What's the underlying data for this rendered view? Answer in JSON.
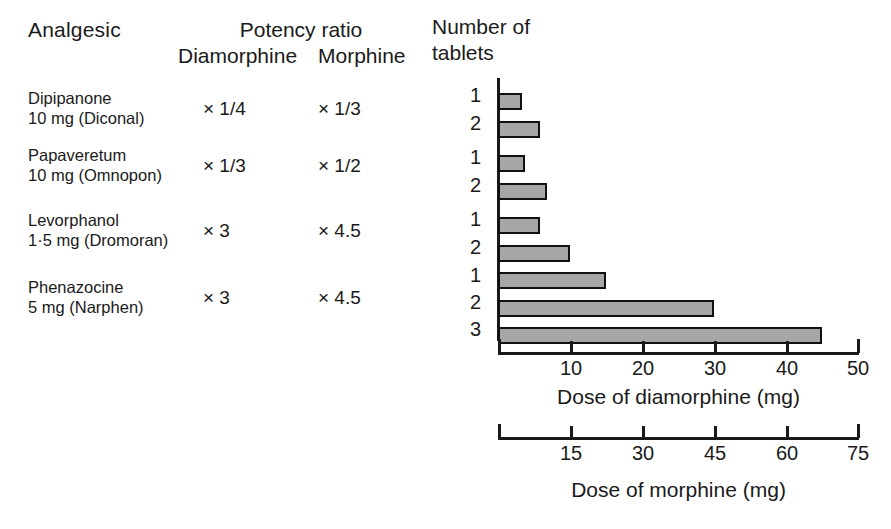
{
  "table": {
    "headers": {
      "analgesic": "Analgesic",
      "potency_ratio": "Potency ratio",
      "diamorphine": "Diamorphine",
      "morphine": "Morphine"
    },
    "rows": [
      {
        "name": "Dipipanone",
        "dose": "10 mg (Diconal)",
        "ratio_diamorphine": "× 1/4",
        "ratio_morphine": "× 1/3"
      },
      {
        "name": "Papaveretum",
        "dose": "10 mg (Omnopon)",
        "ratio_diamorphine": "× 1/3",
        "ratio_morphine": "× 1/2"
      },
      {
        "name": "Levorphanol",
        "dose": "1·5 mg (Dromoran)",
        "ratio_diamorphine": "× 3",
        "ratio_morphine": "× 4.5"
      },
      {
        "name": "Phenazocine",
        "dose": "5 mg (Narphen)",
        "ratio_diamorphine": "× 3",
        "ratio_morphine": "× 4.5"
      }
    ]
  },
  "chart_header": {
    "line1": "Number of",
    "line2": "tablets"
  },
  "chart_data": {
    "type": "bar",
    "orientation": "horizontal",
    "title": "",
    "xlabel": "Dose of diamorphine (mg)",
    "ylabel": "Number of tablets",
    "xlim": [
      0,
      50
    ],
    "xticks": [
      0,
      10,
      20,
      30,
      40,
      50
    ],
    "xticklabels": [
      "",
      "10",
      "20",
      "30",
      "40",
      "50"
    ],
    "grid": false,
    "legend": false,
    "secondary_axis": {
      "label": "Dose of morphine (mg)",
      "lim": [
        0,
        75
      ],
      "ticks": [
        0,
        15,
        30,
        45,
        60,
        75
      ],
      "ticklabels": [
        "",
        "15",
        "30",
        "45",
        "60",
        "75"
      ]
    },
    "bar_fill_color": "#a6a6a6",
    "bar_edge_color": "#111111",
    "categories": [
      "1",
      "2",
      "1",
      "2",
      "1",
      "2",
      "1",
      "2",
      "3"
    ],
    "values": [
      3.3,
      5.8,
      3.7,
      6.8,
      5.8,
      10,
      15,
      30,
      45
    ],
    "groups": [
      {
        "drug": "Dipipanone",
        "tablets": [
          "1",
          "2"
        ],
        "values": [
          3.3,
          5.8
        ]
      },
      {
        "drug": "Papaveretum",
        "tablets": [
          "1",
          "2"
        ],
        "values": [
          3.7,
          6.8
        ]
      },
      {
        "drug": "Levorphanol",
        "tablets": [
          "1",
          "2"
        ],
        "values": [
          5.8,
          10
        ]
      },
      {
        "drug": "Phenazocine",
        "tablets": [
          "1",
          "2",
          "3"
        ],
        "values": [
          15,
          30,
          45
        ]
      }
    ]
  }
}
